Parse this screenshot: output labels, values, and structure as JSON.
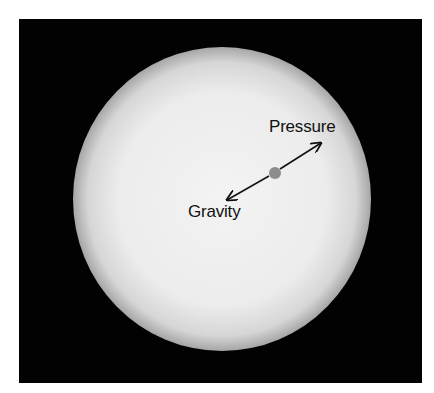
{
  "figure": {
    "background_color": "#000000",
    "sphere": {
      "description": "star / self-gravitating sphere",
      "fill_center": "#f2f2f2",
      "fill_edge": "#a8a8a8"
    },
    "parcel": {
      "description": "gas parcel",
      "color": "#8c8c8c"
    },
    "arrows": [
      {
        "name": "pressure-arrow",
        "direction": "outward"
      },
      {
        "name": "gravity-arrow",
        "direction": "inward"
      }
    ],
    "labels": {
      "pressure": "Pressure",
      "gravity": "Gravity"
    }
  }
}
